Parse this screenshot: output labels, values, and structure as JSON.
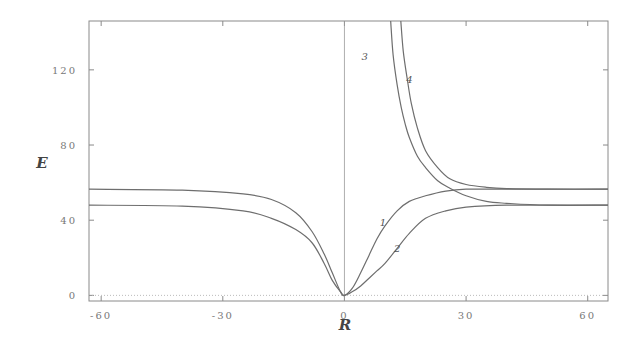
{
  "chart_data": {
    "type": "line",
    "title": "",
    "xlabel": "R",
    "ylabel": "E",
    "xlim": [
      -63,
      65
    ],
    "ylim": [
      -3,
      146
    ],
    "xticks": [
      -60,
      -30,
      0,
      30,
      60
    ],
    "xtick_labels": [
      "-60",
      "-30",
      "0",
      "30",
      "60"
    ],
    "yticks": [
      0,
      40,
      80,
      120
    ],
    "ytick_labels": [
      "0",
      "40",
      "80",
      "120"
    ],
    "grid": false,
    "legend": "none",
    "annotations": [
      {
        "text": "1",
        "x": 9.5,
        "y": 37
      },
      {
        "text": "2",
        "x": 13,
        "y": 23
      },
      {
        "text": "3",
        "x": 5,
        "y": 125
      },
      {
        "text": "4",
        "x": 16,
        "y": 113
      }
    ],
    "baseline_dotted_y": 0,
    "series": [
      {
        "name": "1",
        "x": [
          -63,
          -40,
          -25,
          -18,
          -12,
          -8,
          -5,
          -3,
          -1,
          0,
          2,
          4,
          6,
          8,
          10,
          13,
          16,
          20,
          25,
          30,
          40,
          65
        ],
        "y": [
          56.5,
          56,
          54,
          51,
          44,
          34,
          22,
          12,
          2,
          0,
          4,
          12,
          21,
          30,
          37,
          45,
          50,
          53,
          55.5,
          56.5,
          56.5,
          56.5
        ]
      },
      {
        "name": "2",
        "x": [
          -63,
          -40,
          -25,
          -18,
          -12,
          -8,
          -5,
          -3,
          -1,
          0,
          2,
          4,
          6,
          8,
          10,
          13,
          16,
          20,
          25,
          30,
          40,
          65
        ],
        "y": [
          48,
          47.5,
          45,
          41,
          35,
          28,
          17,
          8,
          2,
          0,
          2,
          5,
          9,
          13,
          17,
          25,
          33,
          41,
          45,
          47,
          48,
          48
        ]
      },
      {
        "name": "3",
        "x": [
          11.4,
          12,
          13,
          14,
          15,
          16,
          18,
          20,
          23,
          26,
          30,
          35,
          40,
          50,
          65
        ],
        "y": [
          146,
          128,
          112,
          100,
          91,
          84,
          74,
          68,
          61,
          57,
          53,
          50,
          49,
          48,
          48
        ]
      },
      {
        "name": "4",
        "x": [
          13.9,
          14.5,
          15.5,
          16.5,
          18,
          20,
          23,
          26,
          30,
          35,
          40,
          50,
          65
        ],
        "y": [
          146,
          130,
          115,
          102,
          89,
          77,
          68,
          62,
          59,
          57.5,
          56.8,
          56.5,
          56.5
        ]
      }
    ]
  },
  "plot": {
    "frame": {
      "left": 89,
      "top": 21,
      "right": 608,
      "bottom": 301
    },
    "colors": {
      "frame": "#8a8a8a",
      "curve": "#6e6e6e",
      "zero_line": "#9a9a9a",
      "baseline": "#bbbbbb"
    }
  }
}
